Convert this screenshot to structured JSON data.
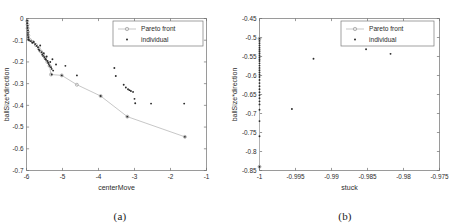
{
  "figure": {
    "panels": [
      {
        "caption": "(a)",
        "chart_data": {
          "type": "scatter",
          "title": "",
          "xlabel": "centerMove",
          "ylabel": "ballSize*direction",
          "xlim": [
            -6,
            -1
          ],
          "ylim": [
            -0.7,
            0
          ],
          "xticks": [
            "-6",
            "-5",
            "-4",
            "-3",
            "-2",
            "-1"
          ],
          "xtick_values": [
            -6,
            -5,
            -4,
            -3,
            -2,
            -1
          ],
          "yticks": [
            "0",
            "-0.1",
            "-0.2",
            "-0.3",
            "-0.4",
            "-0.5",
            "-0.6",
            "-0.7"
          ],
          "ytick_values": [
            0,
            -0.1,
            -0.2,
            -0.3,
            -0.4,
            -0.5,
            -0.6,
            -0.7
          ],
          "grid": false,
          "legend_position": "top-right",
          "series": [
            {
              "name": "Pareto front",
              "marker": "circle",
              "line": true,
              "color": "#b9b9b9",
              "points": [
                [
                  -5.98,
                  -0.012
                ],
                [
                  -5.97,
                  -0.028
                ],
                [
                  -5.97,
                  -0.045
                ],
                [
                  -5.96,
                  -0.062
                ],
                [
                  -5.95,
                  -0.078
                ],
                [
                  -5.95,
                  -0.092
                ],
                [
                  -5.9,
                  -0.1
                ],
                [
                  -5.82,
                  -0.108
                ],
                [
                  -5.74,
                  -0.122
                ],
                [
                  -5.66,
                  -0.138
                ],
                [
                  -5.6,
                  -0.152
                ],
                [
                  -5.54,
                  -0.168
                ],
                [
                  -5.48,
                  -0.182
                ],
                [
                  -5.42,
                  -0.2
                ],
                [
                  -5.36,
                  -0.218
                ],
                [
                  -5.32,
                  -0.258
                ],
                [
                  -5.02,
                  -0.262
                ],
                [
                  -4.6,
                  -0.305
                ],
                [
                  -3.94,
                  -0.357
                ],
                [
                  -3.2,
                  -0.452
                ],
                [
                  -1.6,
                  -0.545
                ]
              ]
            },
            {
              "name": "individual",
              "marker": "dot",
              "line": false,
              "color": "#2a2a2a",
              "points": [
                [
                  -5.98,
                  -0.01
                ],
                [
                  -5.98,
                  -0.022
                ],
                [
                  -5.97,
                  -0.033
                ],
                [
                  -5.97,
                  -0.044
                ],
                [
                  -5.96,
                  -0.055
                ],
                [
                  -5.96,
                  -0.066
                ],
                [
                  -5.96,
                  -0.076
                ],
                [
                  -5.95,
                  -0.086
                ],
                [
                  -5.95,
                  -0.095
                ],
                [
                  -5.93,
                  -0.1
                ],
                [
                  -5.88,
                  -0.104
                ],
                [
                  -5.84,
                  -0.112
                ],
                [
                  -5.8,
                  -0.108
                ],
                [
                  -5.76,
                  -0.118
                ],
                [
                  -5.72,
                  -0.126
                ],
                [
                  -5.68,
                  -0.132
                ],
                [
                  -5.66,
                  -0.142
                ],
                [
                  -5.64,
                  -0.148
                ],
                [
                  -5.62,
                  -0.124
                ],
                [
                  -5.58,
                  -0.155
                ],
                [
                  -5.56,
                  -0.165
                ],
                [
                  -5.54,
                  -0.172
                ],
                [
                  -5.52,
                  -0.16
                ],
                [
                  -5.5,
                  -0.178
                ],
                [
                  -5.48,
                  -0.186
                ],
                [
                  -5.46,
                  -0.19
                ],
                [
                  -5.44,
                  -0.175
                ],
                [
                  -5.42,
                  -0.196
                ],
                [
                  -5.4,
                  -0.204
                ],
                [
                  -5.38,
                  -0.21
                ],
                [
                  -5.36,
                  -0.218
                ],
                [
                  -5.34,
                  -0.2
                ],
                [
                  -5.32,
                  -0.224
                ],
                [
                  -5.3,
                  -0.232
                ],
                [
                  -5.28,
                  -0.188
                ],
                [
                  -5.26,
                  -0.24
                ],
                [
                  -5.3,
                  -0.258
                ],
                [
                  -5.18,
                  -0.212
                ],
                [
                  -5.02,
                  -0.262
                ],
                [
                  -4.92,
                  -0.218
                ],
                [
                  -4.6,
                  -0.262
                ],
                [
                  -3.94,
                  -0.357
                ],
                [
                  -3.56,
                  -0.228
                ],
                [
                  -3.52,
                  -0.265
                ],
                [
                  -3.3,
                  -0.305
                ],
                [
                  -3.24,
                  -0.318
                ],
                [
                  -3.18,
                  -0.326
                ],
                [
                  -3.14,
                  -0.33
                ],
                [
                  -3.1,
                  -0.334
                ],
                [
                  -3.04,
                  -0.338
                ],
                [
                  -3.0,
                  -0.37
                ],
                [
                  -2.98,
                  -0.39
                ],
                [
                  -2.54,
                  -0.392
                ],
                [
                  -1.62,
                  -0.392
                ],
                [
                  -3.2,
                  -0.452
                ],
                [
                  -1.6,
                  -0.545
                ]
              ]
            }
          ]
        },
        "legend": [
          {
            "label": "Pareto front",
            "marker": "circle-line"
          },
          {
            "label": "individual",
            "marker": "dot"
          }
        ]
      },
      {
        "caption": "(b)",
        "chart_data": {
          "type": "scatter",
          "title": "",
          "xlabel": "stuck",
          "ylabel": "ballSize*direction",
          "xlim": [
            -1,
            -0.975
          ],
          "ylim": [
            -0.85,
            -0.45
          ],
          "xticks": [
            "-1",
            "-0.995",
            "-0.99",
            "-0.985",
            "-0.98",
            "-0.975"
          ],
          "xtick_values": [
            -1,
            -0.995,
            -0.99,
            -0.985,
            -0.98,
            -0.975
          ],
          "yticks": [
            "-0.45",
            "-0.5",
            "-0.55",
            "-0.6",
            "-0.65",
            "-0.7",
            "-0.75",
            "-0.8",
            "-0.85"
          ],
          "ytick_values": [
            -0.45,
            -0.5,
            -0.55,
            -0.6,
            -0.65,
            -0.7,
            -0.75,
            -0.8,
            -0.85
          ],
          "grid": false,
          "legend_position": "top-right",
          "series": [
            {
              "name": "Pareto front",
              "marker": "circle",
              "line": true,
              "color": "#b9b9b9",
              "points": [
                [
                  -1,
                  -0.503
                ],
                [
                  -1,
                  -0.84
                ]
              ]
            },
            {
              "name": "individual",
              "marker": "dot",
              "line": false,
              "color": "#2a2a2a",
              "points": [
                [
                  -1,
                  -0.503
                ],
                [
                  -1,
                  -0.509
                ],
                [
                  -1,
                  -0.515
                ],
                [
                  -1,
                  -0.521
                ],
                [
                  -1,
                  -0.527
                ],
                [
                  -1,
                  -0.532
                ],
                [
                  -1,
                  -0.537
                ],
                [
                  -1,
                  -0.542
                ],
                [
                  -1,
                  -0.547
                ],
                [
                  -1,
                  -0.552
                ],
                [
                  -1,
                  -0.557
                ],
                [
                  -1,
                  -0.562
                ],
                [
                  -1,
                  -0.568
                ],
                [
                  -1,
                  -0.574
                ],
                [
                  -1,
                  -0.58
                ],
                [
                  -1,
                  -0.586
                ],
                [
                  -1,
                  -0.592
                ],
                [
                  -1,
                  -0.598
                ],
                [
                  -1,
                  -0.604
                ],
                [
                  -1,
                  -0.612
                ],
                [
                  -1,
                  -0.62
                ],
                [
                  -1,
                  -0.628
                ],
                [
                  -1,
                  -0.636
                ],
                [
                  -1,
                  -0.644
                ],
                [
                  -1,
                  -0.652
                ],
                [
                  -1,
                  -0.66
                ],
                [
                  -1,
                  -0.668
                ],
                [
                  -1,
                  -0.676
                ],
                [
                  -1,
                  -0.69
                ],
                [
                  -1,
                  -0.72
                ],
                [
                  -1,
                  -0.76
                ],
                [
                  -1,
                  -0.84
                ],
                [
                  -0.9925,
                  -0.556
                ],
                [
                  -0.9955,
                  -0.688
                ],
                [
                  -0.9852,
                  -0.531
                ],
                [
                  -0.9818,
                  -0.543
                ]
              ]
            }
          ]
        },
        "legend": [
          {
            "label": "Pareto front",
            "marker": "circle-line"
          },
          {
            "label": "individual",
            "marker": "dot"
          }
        ]
      }
    ]
  }
}
